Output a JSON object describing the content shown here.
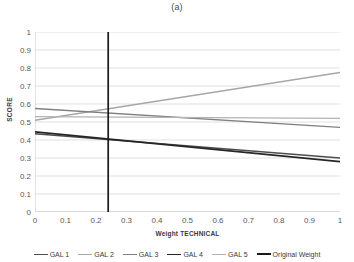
{
  "figure": {
    "caption": "(a)"
  },
  "chart_data": {
    "type": "line",
    "title": "(a)",
    "xlabel": "Weight TECHNICAL",
    "ylabel": "SCORE",
    "xlim": [
      0,
      1
    ],
    "ylim": [
      0,
      1
    ],
    "xticks": [
      "0",
      "0.1",
      "0.2",
      "0.3",
      "0.4",
      "0.5",
      "0.6",
      "0.7",
      "0.8",
      "0.9",
      "1"
    ],
    "yticks": [
      "0",
      "0.1",
      "0.2",
      "0.3",
      "0.4",
      "0.5",
      "0.6",
      "0.7",
      "0.8",
      "0.9",
      "1"
    ],
    "grid": "horizontal",
    "legend_position": "bottom",
    "x": [
      0,
      1
    ],
    "series": [
      {
        "name": "GAL 1",
        "values": [
          0.435,
          0.3
        ],
        "color": "#4d4d4d",
        "width": 1.6
      },
      {
        "name": "GAL 2",
        "values": [
          0.51,
          0.775
        ],
        "color": "#a6a6a6",
        "width": 1.4
      },
      {
        "name": "GAL 3",
        "values": [
          0.575,
          0.47
        ],
        "color": "#808080",
        "width": 1.4
      },
      {
        "name": "GAL 4",
        "values": [
          0.445,
          0.28
        ],
        "color": "#262626",
        "width": 1.6
      },
      {
        "name": "GAL 5",
        "values": [
          0.53,
          0.52
        ],
        "color": "#b3b3b3",
        "width": 1.4
      }
    ],
    "vertical_marker": {
      "name": "Original Weight",
      "x": 0.24,
      "y_from": 0,
      "y_to": 1,
      "color": "#1a1a1a",
      "width": 1.7
    }
  },
  "legend": {
    "items": [
      {
        "label": "GAL 1",
        "color": "#4d4d4d",
        "width": 1.6
      },
      {
        "label": "GAL 2",
        "color": "#a6a6a6",
        "width": 1.3
      },
      {
        "label": "GAL 3",
        "color": "#808080",
        "width": 1.4
      },
      {
        "label": "GAL 4",
        "color": "#262626",
        "width": 1.8
      },
      {
        "label": "GAL 5",
        "color": "#b3b3b3",
        "width": 1.3
      },
      {
        "label": "Original Weight",
        "color": "#1a1a1a",
        "width": 2.0
      }
    ]
  },
  "colors": {
    "grid": "#d9d9d9",
    "axis": "#bfbfbf",
    "tick_text": "#595959",
    "title_text": "#3a3a3a",
    "background": "#ffffff"
  }
}
